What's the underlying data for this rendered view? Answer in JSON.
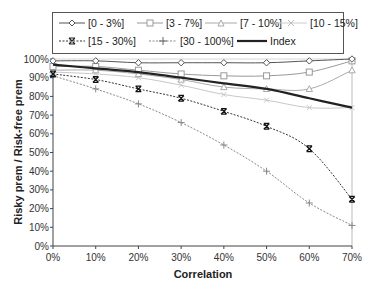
{
  "chart_data": {
    "type": "line",
    "title": "",
    "xlabel": "Correlation",
    "ylabel": "Risky prem / Risk-free prem",
    "x": [
      "0%",
      "10%",
      "20%",
      "30%",
      "40%",
      "50%",
      "60%",
      "70%"
    ],
    "x_values": [
      0,
      10,
      20,
      30,
      40,
      50,
      60,
      70
    ],
    "y_ticks": [
      "0%",
      "10%",
      "20%",
      "30%",
      "40%",
      "50%",
      "60%",
      "70%",
      "80%",
      "90%",
      "100%"
    ],
    "ylim": [
      0,
      100
    ],
    "grid": false,
    "legend_position": "top",
    "series": [
      {
        "name": "[0 - 3%]",
        "marker": "diamond",
        "style": "solid",
        "color": "#555555",
        "values": [
          99,
          99,
          98,
          98,
          98,
          98,
          99,
          100
        ]
      },
      {
        "name": "[3 - 7%]",
        "marker": "square",
        "style": "solid",
        "color": "#999999",
        "values": [
          96,
          96,
          94,
          92,
          91,
          91,
          93,
          99
        ]
      },
      {
        "name": "[7 - 10%]",
        "marker": "triangle",
        "style": "solid",
        "color": "#aaaaaa",
        "values": [
          94,
          94,
          92,
          89,
          85,
          84,
          84,
          94
        ]
      },
      {
        "name": "[10 - 15%]",
        "marker": "x",
        "style": "solid",
        "color": "#c8c8c8",
        "values": [
          93,
          92,
          90,
          86,
          81,
          78,
          74,
          74
        ]
      },
      {
        "name": "[15 - 30%]",
        "marker": "star-x",
        "style": "dashed",
        "color": "#333333",
        "values": [
          92,
          89,
          84,
          79,
          72,
          64,
          52,
          25
        ]
      },
      {
        "name": "[30 - 100%]",
        "marker": "plus",
        "style": "dashed",
        "color": "#888888",
        "values": [
          91,
          84,
          76,
          66,
          54,
          40,
          23,
          11
        ]
      },
      {
        "name": "Index",
        "marker": "none",
        "style": "solid-thick",
        "color": "#222222",
        "values": [
          97,
          95,
          93,
          90,
          87,
          84,
          79,
          74
        ]
      }
    ]
  },
  "legend": {
    "items": [
      {
        "label": "[0 - 3%]"
      },
      {
        "label": "[3 - 7%]"
      },
      {
        "label": "[7 - 10%]"
      },
      {
        "label": "[10 - 15%]"
      },
      {
        "label": "[15 - 30%]"
      },
      {
        "label": "[30 - 100%]"
      },
      {
        "label": "Index"
      }
    ]
  },
  "axes": {
    "xlabel": "Correlation",
    "ylabel": "Risky prem / Risk-free prem"
  }
}
